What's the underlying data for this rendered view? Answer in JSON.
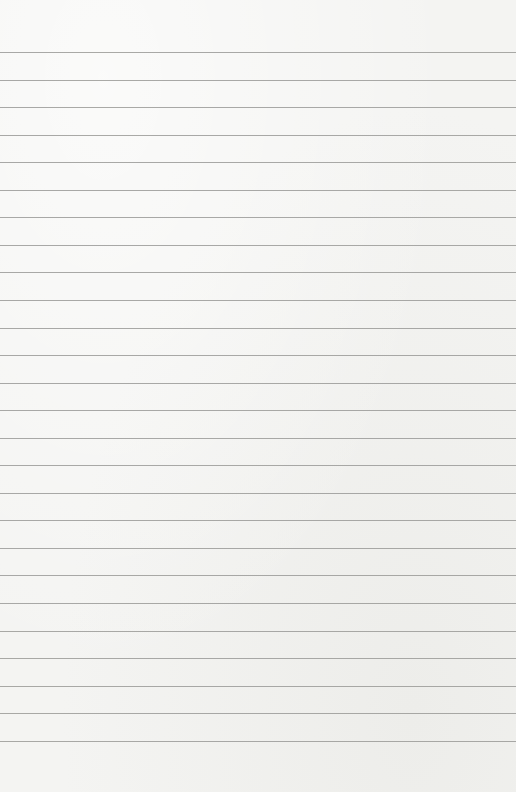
{
  "page": {
    "type": "lined-paper",
    "background_color": "#f4f4f2",
    "rule_color": "#9a9a98",
    "rule_count": 26,
    "text": ""
  }
}
